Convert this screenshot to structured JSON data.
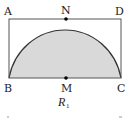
{
  "figure": {
    "caption_main": "R",
    "caption_sub": "1",
    "points": {
      "A": "A",
      "N": "N",
      "D": "D",
      "B": "B",
      "M": "M",
      "C": "C"
    },
    "colors": {
      "stroke": "#333333",
      "fill": "#d9d9d9",
      "point": "#000000"
    },
    "shapes": {
      "rectangle": "ABCD",
      "semicircle": "center M, diameter BC, tangent to AD at N"
    }
  }
}
